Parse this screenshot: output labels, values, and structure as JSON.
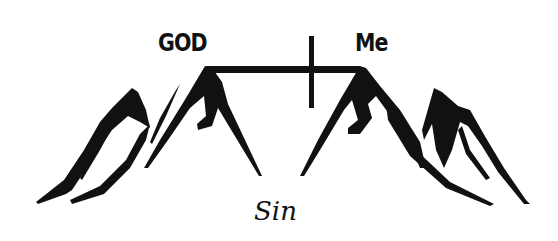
{
  "diagram": {
    "left_label": "GOD",
    "right_label": "Me",
    "bottom_label": "Sin",
    "elements": [
      {
        "name": "left-mountain",
        "description": "mountain peaks on the left"
      },
      {
        "name": "right-mountain",
        "description": "mountain peaks on the right"
      },
      {
        "name": "cross-bridge",
        "description": "cross bridging the gap between the two peaks"
      }
    ],
    "colors": {
      "ink": "#111111",
      "background": "#ffffff"
    }
  }
}
